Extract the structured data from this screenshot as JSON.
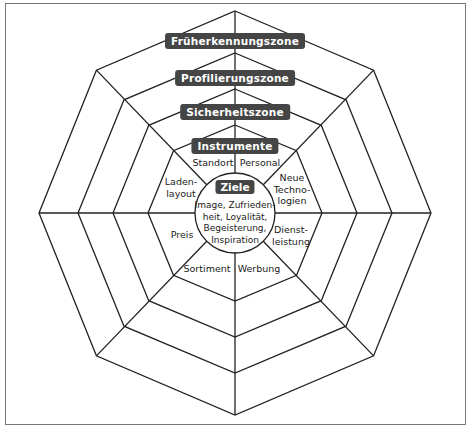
{
  "zones": {
    "fruehkennung": "Früherkennungszone",
    "profilierung": "Profilierungszone",
    "sicherheit": "Sicherheitszone",
    "instrumente": "Instrumente"
  },
  "center": {
    "title": "Ziele",
    "lines": [
      "Image, Zufrieden-",
      "heit, Loyalität,",
      "Begeisterung,",
      "Inspiration"
    ]
  },
  "instruments": {
    "standort": "Standort",
    "personal": "Personal",
    "neue_technologien": [
      "Neue",
      "Techno-",
      "logien"
    ],
    "dienstleistung": [
      "Dienst-",
      "leistung"
    ],
    "werbung": "Werbung",
    "sortiment": "Sortiment",
    "preis": "Preis",
    "ladenlayout": [
      "Laden-",
      "layout"
    ]
  },
  "colors": {
    "label_bg": "#454545",
    "line": "#222222",
    "frame": "#777777"
  }
}
